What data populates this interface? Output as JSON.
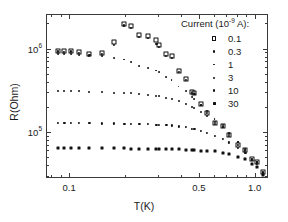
{
  "chart_data": {
    "type": "scatter",
    "title": "",
    "xlabel": "T(K)",
    "ylabel": "R(Ohm)",
    "xscale": "log",
    "yscale": "log",
    "xlim": [
      0.075,
      1.18
    ],
    "ylim": [
      28000,
      2600000
    ],
    "grid": false,
    "legend_position": "top-right",
    "legend_title": "Current (10",
    "legend_title_exp": "-9",
    "legend_title_tail": " A):",
    "xticks": [
      {
        "value": 0.1,
        "label": "0.1"
      },
      {
        "value": 0.5,
        "label": "0.5"
      },
      {
        "value": 1.0,
        "label": "1.0"
      }
    ],
    "yticks": [
      {
        "value": 1000000,
        "mantissa": "10",
        "exponent": "6"
      },
      {
        "value": 100000,
        "mantissa": "10",
        "exponent": "5"
      }
    ],
    "series": [
      {
        "name": "0.1",
        "label": "0.1",
        "marker": "open-square",
        "size": 2.4,
        "color": "#111111",
        "points": [
          [
            0.086,
            960000
          ],
          [
            0.093,
            950000
          ],
          [
            0.101,
            960000
          ],
          [
            0.112,
            930000
          ],
          [
            0.127,
            880000
          ],
          [
            0.148,
            900000
          ],
          [
            0.172,
            1250000
          ],
          [
            0.196,
            2050000
          ],
          [
            0.213,
            1900000
          ],
          [
            0.236,
            1500000
          ],
          [
            0.263,
            1450000
          ],
          [
            0.292,
            1300000
          ],
          [
            0.3,
            1150000
          ],
          [
            0.33,
            880000
          ],
          [
            0.352,
            830000
          ],
          [
            0.384,
            560000
          ],
          [
            0.42,
            440000
          ],
          [
            0.452,
            310000
          ],
          [
            0.468,
            300000
          ],
          [
            0.505,
            220000
          ],
          [
            0.545,
            175000
          ],
          [
            0.6,
            130000
          ],
          [
            0.665,
            120000
          ],
          [
            0.72,
            95000
          ],
          [
            0.8,
            72000
          ],
          [
            0.88,
            62000
          ],
          [
            0.95,
            48000
          ],
          [
            1.02,
            45000
          ],
          [
            1.09,
            34000
          ]
        ]
      },
      {
        "name": "0.3",
        "label": "0.3",
        "marker": "dot",
        "size": 2.1,
        "color": "#111111",
        "points": [
          [
            0.086,
            950000
          ],
          [
            0.093,
            940000
          ],
          [
            0.101,
            950000
          ],
          [
            0.112,
            920000
          ],
          [
            0.127,
            870000
          ],
          [
            0.148,
            880000
          ],
          [
            0.172,
            1150000
          ],
          [
            0.196,
            1950000
          ],
          [
            0.213,
            1820000
          ],
          [
            0.236,
            1420000
          ],
          [
            0.263,
            1380000
          ],
          [
            0.292,
            1180000
          ],
          [
            0.3,
            1080000
          ],
          [
            0.33,
            840000
          ],
          [
            0.352,
            800000
          ],
          [
            0.384,
            540000
          ],
          [
            0.42,
            430000
          ],
          [
            0.452,
            305000
          ],
          [
            0.468,
            295000
          ],
          [
            0.505,
            215000
          ],
          [
            0.545,
            172000
          ],
          [
            0.6,
            128000
          ],
          [
            0.665,
            118000
          ],
          [
            0.72,
            93000
          ],
          [
            0.8,
            71000
          ],
          [
            0.88,
            61000
          ],
          [
            0.95,
            47500
          ],
          [
            1.02,
            44500
          ],
          [
            1.09,
            33500
          ]
        ]
      },
      {
        "name": "1",
        "label": "1",
        "marker": "dot",
        "size": 1.9,
        "color": "#111111",
        "points": [
          [
            0.086,
            880000
          ],
          [
            0.093,
            875000
          ],
          [
            0.101,
            880000
          ],
          [
            0.112,
            865000
          ],
          [
            0.127,
            845000
          ],
          [
            0.148,
            830000
          ],
          [
            0.172,
            800000
          ],
          [
            0.196,
            760000
          ],
          [
            0.213,
            700000
          ],
          [
            0.236,
            640000
          ],
          [
            0.263,
            600000
          ],
          [
            0.292,
            560000
          ],
          [
            0.3,
            540000
          ],
          [
            0.33,
            470000
          ],
          [
            0.352,
            430000
          ],
          [
            0.384,
            360000
          ],
          [
            0.42,
            320000
          ],
          [
            0.452,
            270000
          ],
          [
            0.468,
            255000
          ],
          [
            0.505,
            215000
          ],
          [
            0.545,
            185000
          ],
          [
            0.6,
            145000
          ],
          [
            0.665,
            125000
          ],
          [
            0.72,
            100000
          ],
          [
            0.8,
            78000
          ],
          [
            0.88,
            64000
          ],
          [
            0.95,
            49000
          ],
          [
            1.02,
            45000
          ],
          [
            1.09,
            34000
          ]
        ]
      },
      {
        "name": "3",
        "label": "3",
        "marker": "dot",
        "size": 2.0,
        "color": "#111111",
        "points": [
          [
            0.086,
            320000
          ],
          [
            0.093,
            318000
          ],
          [
            0.101,
            320000
          ],
          [
            0.112,
            315000
          ],
          [
            0.127,
            312000
          ],
          [
            0.148,
            308000
          ],
          [
            0.172,
            305000
          ],
          [
            0.196,
            300000
          ],
          [
            0.213,
            298000
          ],
          [
            0.236,
            292000
          ],
          [
            0.263,
            288000
          ],
          [
            0.292,
            280000
          ],
          [
            0.3,
            278000
          ],
          [
            0.33,
            265000
          ],
          [
            0.352,
            255000
          ],
          [
            0.384,
            240000
          ],
          [
            0.42,
            225000
          ],
          [
            0.452,
            205000
          ],
          [
            0.468,
            198000
          ],
          [
            0.505,
            180000
          ],
          [
            0.545,
            160000
          ],
          [
            0.6,
            135000
          ],
          [
            0.665,
            118000
          ],
          [
            0.72,
            98000
          ],
          [
            0.8,
            77000
          ],
          [
            0.88,
            63000
          ],
          [
            0.95,
            49000
          ],
          [
            1.02,
            45000
          ],
          [
            1.09,
            34000
          ]
        ]
      },
      {
        "name": "10",
        "label": "10",
        "marker": "dot",
        "size": 2.2,
        "color": "#111111",
        "points": [
          [
            0.086,
            133000
          ],
          [
            0.093,
            132000
          ],
          [
            0.101,
            133000
          ],
          [
            0.112,
            132000
          ],
          [
            0.127,
            131000
          ],
          [
            0.148,
            130000
          ],
          [
            0.172,
            130000
          ],
          [
            0.196,
            129000
          ],
          [
            0.213,
            129000
          ],
          [
            0.236,
            128000
          ],
          [
            0.263,
            127000
          ],
          [
            0.292,
            126000
          ],
          [
            0.3,
            126000
          ],
          [
            0.33,
            124000
          ],
          [
            0.352,
            123000
          ],
          [
            0.384,
            120000
          ],
          [
            0.42,
            117000
          ],
          [
            0.452,
            113000
          ],
          [
            0.468,
            111000
          ],
          [
            0.505,
            106000
          ],
          [
            0.545,
            100000
          ],
          [
            0.6,
            92000
          ],
          [
            0.665,
            84000
          ],
          [
            0.72,
            77000
          ],
          [
            0.8,
            66000
          ],
          [
            0.88,
            58000
          ],
          [
            0.95,
            47000
          ],
          [
            1.02,
            43000
          ],
          [
            1.09,
            33000
          ]
        ]
      },
      {
        "name": "30",
        "label": "30",
        "marker": "square",
        "size": 3.0,
        "color": "#111111",
        "points": [
          [
            0.086,
            66000
          ],
          [
            0.093,
            66000
          ],
          [
            0.101,
            66000
          ],
          [
            0.112,
            66000
          ],
          [
            0.127,
            66000
          ],
          [
            0.148,
            65500
          ],
          [
            0.172,
            65500
          ],
          [
            0.196,
            65500
          ],
          [
            0.213,
            65000
          ],
          [
            0.236,
            65000
          ],
          [
            0.263,
            65000
          ],
          [
            0.292,
            64500
          ],
          [
            0.3,
            64500
          ],
          [
            0.33,
            64000
          ],
          [
            0.352,
            64000
          ],
          [
            0.384,
            63500
          ],
          [
            0.42,
            63000
          ],
          [
            0.452,
            62500
          ],
          [
            0.468,
            62000
          ],
          [
            0.505,
            61500
          ],
          [
            0.545,
            61000
          ],
          [
            0.6,
            60000
          ],
          [
            0.665,
            58000
          ],
          [
            0.72,
            56000
          ],
          [
            0.8,
            52000
          ],
          [
            0.88,
            48000
          ],
          [
            0.95,
            42000
          ],
          [
            1.02,
            39000
          ],
          [
            1.09,
            31000
          ]
        ]
      }
    ]
  }
}
